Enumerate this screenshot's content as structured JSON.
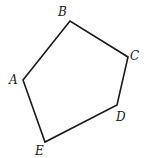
{
  "diagram": {
    "type": "pentagon",
    "vertices": [
      {
        "name": "A",
        "x": 23,
        "y": 80,
        "label_x": 9,
        "label_y": 84
      },
      {
        "name": "B",
        "x": 70,
        "y": 21,
        "label_x": 58,
        "label_y": 16
      },
      {
        "name": "C",
        "x": 128,
        "y": 57,
        "label_x": 130,
        "label_y": 60
      },
      {
        "name": "D",
        "x": 117,
        "y": 105,
        "label_x": 116,
        "label_y": 121
      },
      {
        "name": "E",
        "x": 45,
        "y": 142,
        "label_x": 35,
        "label_y": 155
      }
    ],
    "edges": [
      "AB",
      "BC",
      "CD",
      "DE",
      "EA"
    ],
    "stroke_color": "#1a1a1a"
  }
}
